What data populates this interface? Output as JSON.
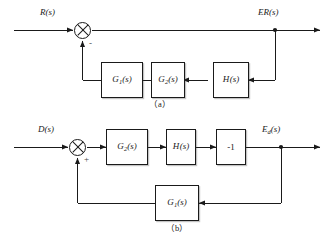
{
  "figure": {
    "type": "control-system-block-diagram",
    "background_color": "#ffffff",
    "line_color": "#1a1a1a",
    "text_color": "#1a1a1a"
  },
  "diagram_a": {
    "caption": "（a）",
    "input_label": "R(s)",
    "output_label": "ER(s)",
    "summing_junction": {
      "symbol": "crossed-circle",
      "feedback_sign": "-"
    },
    "forward_blocks": [],
    "feedback_blocks": [
      {
        "label": "G",
        "subscript": "1",
        "arg": "(s)",
        "full": "G1(s)"
      },
      {
        "label": "G",
        "subscript": "2",
        "arg": "(s)",
        "full": "G2(s)"
      },
      {
        "label": "H",
        "subscript": "",
        "arg": "(s)",
        "full": "H(s)"
      }
    ]
  },
  "diagram_b": {
    "caption": "（b）",
    "input_label": "D(s)",
    "output_label_main": "E",
    "output_label_sub": "d",
    "output_label_arg": "(s)",
    "output_label_full": "Ed(s)",
    "summing_junction": {
      "symbol": "crossed-circle",
      "feedback_sign": "+"
    },
    "forward_blocks": [
      {
        "label": "G",
        "subscript": "2",
        "arg": "(s)",
        "full": "G2(s)"
      },
      {
        "label": "H",
        "subscript": "",
        "arg": "(s)",
        "full": "H(s)"
      },
      {
        "label": "-1",
        "subscript": "",
        "arg": "",
        "full": "-1"
      }
    ],
    "feedback_blocks": [
      {
        "label": "G",
        "subscript": "1",
        "arg": "(s)",
        "full": "G1(s)"
      }
    ]
  }
}
